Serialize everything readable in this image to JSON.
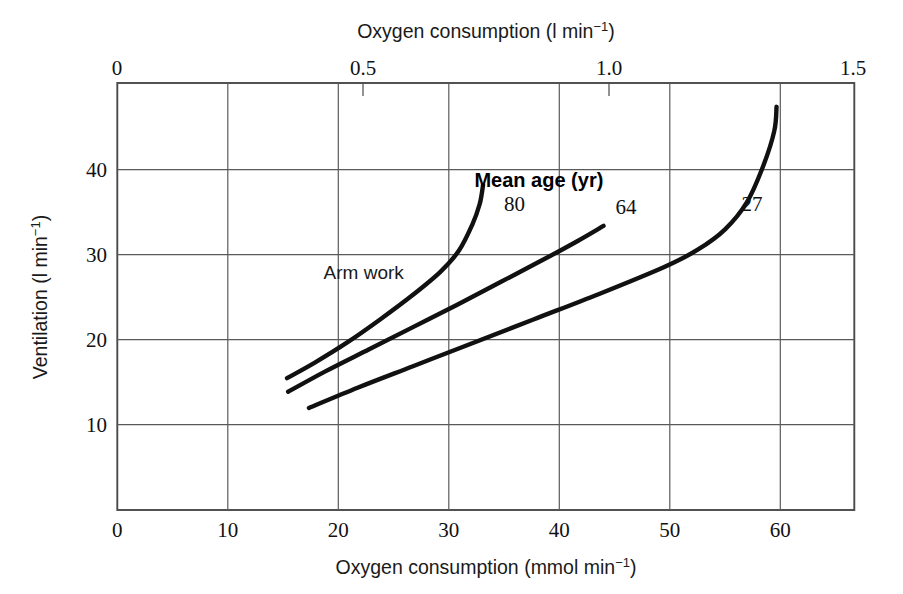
{
  "figure": {
    "background": "#ffffff",
    "ink": "#111111",
    "grid_color": "#5a5a5a"
  },
  "chart_data": {
    "type": "line",
    "title": "",
    "subtitle": "",
    "xlabel": "Oxygen consumption (mmol min−1)",
    "xlabel_top": "Oxygen consumption (l min−1)",
    "ylabel": "Ventilation (l min−1)",
    "xlim": [
      0,
      67.3
    ],
    "ylim": [
      0,
      50.2
    ],
    "xlim_top": [
      0,
      1.5
    ],
    "grid": true,
    "legend_position": "inline-curve-labels",
    "legend_title": "Mean age (yr)",
    "axes": {
      "x_bottom": {
        "label_html": "Oxygen consumption (mmol min⁻¹)",
        "label_base": "Oxygen consumption (mmol min",
        "label_sup": "−1",
        "label_tail": ")",
        "ticks": [
          0,
          10,
          20,
          30,
          40,
          50,
          60
        ],
        "tick_labels": [
          "0",
          "10",
          "20",
          "30",
          "40",
          "50",
          "60"
        ],
        "units": "mmol min⁻¹"
      },
      "x_top": {
        "label_base": "Oxygen consumption (l min",
        "label_sup": "−1",
        "label_tail": ")",
        "ticks": [
          0,
          0.5,
          1.0,
          1.5
        ],
        "tick_labels": [
          "0",
          "0.5",
          "1.0",
          "1.5"
        ],
        "minor_ticks": [
          0.5,
          1.0
        ],
        "units": "l min⁻¹"
      },
      "y_left": {
        "label_base": "Ventilation (l min",
        "label_sup": "−1",
        "label_tail": ")",
        "ticks": [
          10,
          20,
          30,
          40
        ],
        "tick_labels": [
          "10",
          "20",
          "30",
          "40"
        ],
        "units": "l min⁻¹"
      }
    },
    "annotations": [
      {
        "name": "arm-work",
        "text": "Arm work",
        "x": 22.5,
        "y": 27.2
      },
      {
        "name": "legend-title",
        "text": "Mean age (yr)",
        "x": 38.5,
        "y": 38.0,
        "bold": true
      }
    ],
    "series": [
      {
        "name": "80",
        "label": "80",
        "label_x": 35.3,
        "label_y": 35.2,
        "points": [
          [
            15.5,
            15.5
          ],
          [
            18.0,
            17.3
          ],
          [
            21.0,
            19.7
          ],
          [
            24.0,
            22.4
          ],
          [
            27.0,
            25.3
          ],
          [
            29.5,
            28.0
          ],
          [
            31.2,
            30.5
          ],
          [
            32.4,
            33.5
          ],
          [
            33.1,
            36.0
          ],
          [
            33.4,
            38.2
          ]
        ]
      },
      {
        "name": "64",
        "label": "64",
        "label_x": 45.5,
        "label_y": 34.8,
        "points": [
          [
            15.6,
            13.9
          ],
          [
            19.0,
            16.3
          ],
          [
            23.0,
            18.9
          ],
          [
            27.0,
            21.5
          ],
          [
            31.0,
            24.1
          ],
          [
            35.0,
            26.8
          ],
          [
            39.0,
            29.5
          ],
          [
            42.0,
            31.6
          ],
          [
            44.4,
            33.4
          ]
        ]
      },
      {
        "name": "27",
        "label": "27",
        "label_x": 57.0,
        "label_y": 35.2,
        "points": [
          [
            17.5,
            12.0
          ],
          [
            22.0,
            14.4
          ],
          [
            27.0,
            16.9
          ],
          [
            32.0,
            19.4
          ],
          [
            38.0,
            22.4
          ],
          [
            44.0,
            25.4
          ],
          [
            50.0,
            28.6
          ],
          [
            53.0,
            30.6
          ],
          [
            55.5,
            33.0
          ],
          [
            57.5,
            36.2
          ],
          [
            59.0,
            40.5
          ],
          [
            60.0,
            44.6
          ],
          [
            60.2,
            47.4
          ]
        ]
      }
    ]
  }
}
